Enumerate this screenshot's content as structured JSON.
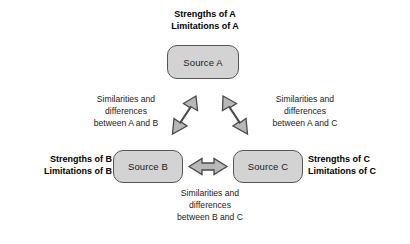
{
  "diagram": {
    "title_text": "Source comparison triangle",
    "nodes": [
      {
        "id": "a",
        "label": "Source A"
      },
      {
        "id": "b",
        "label": "Source B"
      },
      {
        "id": "c",
        "label": "Source C"
      }
    ],
    "side_labels": [
      {
        "id": "a",
        "text": "Strengths of A\nLimitations of A"
      },
      {
        "id": "b",
        "text": "Strengths of B\nLimitations of B"
      },
      {
        "id": "c",
        "text": "Strengths of C\nLimitations of C"
      }
    ],
    "edge_labels": [
      {
        "id": "ab",
        "text": "Similarities and\ndifferences\nbetween A and B"
      },
      {
        "id": "ac",
        "text": "Similarities and\ndifferences\nbetween A and C"
      },
      {
        "id": "bc",
        "text": "Similarities and\ndifferences\nbetween B and C"
      }
    ],
    "connectors": [
      {
        "id": "ab",
        "kind": "double-headed-arrow",
        "orientation": "diagonal-up-right"
      },
      {
        "id": "ac",
        "kind": "double-headed-arrow",
        "orientation": "diagonal-up-left"
      },
      {
        "id": "bc",
        "kind": "double-headed-arrow",
        "orientation": "horizontal"
      }
    ],
    "colors": {
      "node_fill": "#d3d3d3",
      "node_border": "#555555",
      "arrow_fill": "#b8b8b8",
      "arrow_border": "#4a4a4a",
      "background": "#ffffff",
      "text": "#1b1b1b"
    }
  }
}
